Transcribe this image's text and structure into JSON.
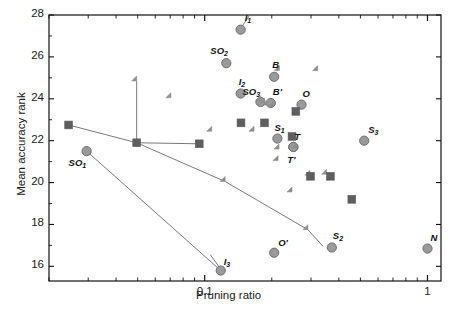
{
  "chart_data": {
    "type": "scatter",
    "title": "",
    "xlabel": "Pruning ratio",
    "ylabel": "Mean accuracy rank",
    "xscale": "log",
    "yscale": "linear",
    "xlim": [
      0.02,
      1.15
    ],
    "ylim": [
      15.3,
      28.0
    ],
    "xticks_major": [
      0.1,
      1
    ],
    "xtick_labels": [
      "0.1",
      "1"
    ],
    "yticks": [
      16,
      18,
      20,
      22,
      24,
      26,
      28
    ],
    "ytick_labels": [
      "16",
      "18",
      "20",
      "22",
      "24",
      "26",
      "28"
    ],
    "grid": false,
    "legend": "none",
    "colors": {
      "circle": "#9a9a9a",
      "circle_edge": "#6e6e6e",
      "diamond": "#8e8e8e",
      "square": "#5e5e5e",
      "line": "#7a7a7a",
      "axis": "#111111",
      "text": "#111111"
    },
    "series": [
      {
        "name": "labeled-circles",
        "marker": "circle",
        "points": [
          {
            "label": "I_1",
            "label_text": "I",
            "sub": "1",
            "x": 0.145,
            "y": 27.3
          },
          {
            "label": "SO_2",
            "label_text": "SO",
            "sub": "2",
            "x": 0.125,
            "y": 25.7
          },
          {
            "label": "I_2",
            "label_text": "I",
            "sub": "2",
            "x": 0.145,
            "y": 24.25
          },
          {
            "label": "B",
            "label_text": "B",
            "sub": "",
            "x": 0.205,
            "y": 25.05
          },
          {
            "label": "SO_3",
            "label_text": "SO",
            "sub": "3",
            "x": 0.178,
            "y": 23.85
          },
          {
            "label": "B'",
            "label_text": "B'",
            "sub": "",
            "x": 0.198,
            "y": 23.8
          },
          {
            "label": "O",
            "label_text": "O",
            "sub": "",
            "x": 0.272,
            "y": 23.72
          },
          {
            "label": "S_1",
            "label_text": "S",
            "sub": "1",
            "x": 0.212,
            "y": 22.1
          },
          {
            "label": "T",
            "label_text": "T",
            "sub": "",
            "x": 0.25,
            "y": 21.7
          },
          {
            "label": "T'",
            "label_text": "T'",
            "sub": "",
            "x": 0.25,
            "y": 21.7
          },
          {
            "label": "S_3",
            "label_text": "S",
            "sub": "3",
            "x": 0.52,
            "y": 22.0
          },
          {
            "label": "SO_1",
            "label_text": "SO",
            "sub": "1",
            "x": 0.0295,
            "y": 21.5
          },
          {
            "label": "I_3",
            "label_text": "I",
            "sub": "3",
            "x": 0.118,
            "y": 15.8
          },
          {
            "label": "O'",
            "label_text": "O'",
            "sub": "",
            "x": 0.205,
            "y": 16.65
          },
          {
            "label": "S_2",
            "label_text": "S",
            "sub": "2",
            "x": 0.372,
            "y": 16.9
          },
          {
            "label": "N",
            "label_text": "N",
            "sub": "",
            "x": 1.0,
            "y": 16.85
          }
        ]
      },
      {
        "name": "diamonds",
        "marker": "diamond",
        "points": [
          {
            "x": 0.0495,
            "y": 24.85
          },
          {
            "x": 0.0705,
            "y": 24.05
          },
          {
            "x": 0.3215,
            "y": 25.35
          },
          {
            "x": 0.2165,
            "y": 25.35
          },
          {
            "x": 0.1785,
            "y": 23.9
          },
          {
            "x": 0.1855,
            "y": 23.8
          },
          {
            "x": 0.1925,
            "y": 23.7
          },
          {
            "x": 0.2025,
            "y": 23.62
          },
          {
            "x": 0.1075,
            "y": 22.45
          },
          {
            "x": 0.1665,
            "y": 22.45
          },
          {
            "x": 0.2155,
            "y": 21.6
          },
          {
            "x": 0.2135,
            "y": 21.05
          },
          {
            "x": 0.2585,
            "y": 21.65
          },
          {
            "x": 0.2965,
            "y": 20.35
          },
          {
            "x": 0.3525,
            "y": 20.4
          },
          {
            "x": 0.1235,
            "y": 20.05
          },
          {
            "x": 0.2465,
            "y": 19.55
          },
          {
            "x": 0.2905,
            "y": 17.75
          }
        ]
      },
      {
        "name": "squares",
        "marker": "square",
        "points": [
          {
            "x": 0.0245,
            "y": 22.75
          },
          {
            "x": 0.0495,
            "y": 21.9
          },
          {
            "x": 0.0945,
            "y": 21.85
          },
          {
            "x": 0.1455,
            "y": 22.85
          },
          {
            "x": 0.1855,
            "y": 22.85
          },
          {
            "x": 0.2565,
            "y": 23.4
          },
          {
            "x": 0.2465,
            "y": 22.2
          },
          {
            "x": 0.2985,
            "y": 20.3
          },
          {
            "x": 0.3665,
            "y": 20.3
          },
          {
            "x": 0.4575,
            "y": 19.2
          }
        ]
      }
    ],
    "connected_lines": [
      {
        "name": "square-line",
        "points": [
          {
            "x": 0.0245,
            "y": 22.75
          },
          {
            "x": 0.0495,
            "y": 21.9
          },
          {
            "x": 0.0945,
            "y": 21.85
          }
        ]
      },
      {
        "name": "diamond-line",
        "points": [
          {
            "x": 0.0495,
            "y": 24.85
          },
          {
            "x": 0.0495,
            "y": 21.9
          },
          {
            "x": 0.1235,
            "y": 20.05
          },
          {
            "x": 0.2905,
            "y": 17.75
          },
          {
            "x": 0.34,
            "y": 16.95
          }
        ]
      },
      {
        "name": "so1-to-i3-line",
        "points": [
          {
            "x": 0.0295,
            "y": 21.5
          },
          {
            "x": 0.118,
            "y": 15.8
          }
        ]
      },
      {
        "name": "i1-leader",
        "points": [
          {
            "x": 0.158,
            "y": 27.95
          },
          {
            "x": 0.145,
            "y": 27.35
          }
        ]
      },
      {
        "name": "i3-leader",
        "points": [
          {
            "x": 0.106,
            "y": 16.55
          },
          {
            "x": 0.1165,
            "y": 15.95
          }
        ]
      }
    ]
  },
  "labels": {
    "xlabel": "Pruning ratio",
    "ylabel": "Mean accuracy rank",
    "x_ticks": [
      "0.1",
      "1"
    ],
    "y_ticks": [
      "28",
      "26",
      "24",
      "22",
      "20",
      "18",
      "16"
    ]
  }
}
